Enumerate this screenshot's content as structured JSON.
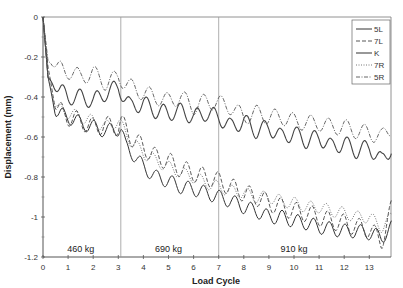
{
  "chart_data": {
    "type": "line",
    "title": "",
    "xlabel": "Load Cycle",
    "ylabel": "Displacement (mm)",
    "xlim": [
      0,
      14
    ],
    "ylim": [
      -1.2,
      0
    ],
    "x_ticks": [
      "0",
      "1",
      "2",
      "3",
      "4",
      "5",
      "6",
      "7",
      "8",
      "9",
      "10",
      "11",
      "12",
      "13"
    ],
    "y_ticks": [
      "0",
      "-0.2",
      "-0.4",
      "-0.6",
      "-0.8",
      "-1",
      "-1.2"
    ],
    "grid": false,
    "vertical_lines_at": [
      3.1,
      7.0
    ],
    "legend_position": "upper right",
    "annotations": [
      {
        "text": "460 kg",
        "x": 1.5,
        "y": -1.17
      },
      {
        "text": "690 kg",
        "x": 5.0,
        "y": -1.17
      },
      {
        "text": "910 kg",
        "x": 10.0,
        "y": -1.17
      }
    ],
    "series": [
      {
        "name": "5L",
        "style": "solid",
        "x": [
          0,
          0.2,
          0.5,
          1,
          1.5,
          2,
          2.5,
          3,
          3.1,
          3.3,
          3.7,
          4,
          4.5,
          5,
          5.5,
          6,
          6.5,
          7,
          7.5,
          8,
          8.5,
          9,
          9.5,
          10,
          10.5,
          11,
          11.5,
          12,
          12.5,
          13,
          13.5,
          13.9
        ],
        "y": [
          0,
          -0.3,
          -0.48,
          -0.5,
          -0.53,
          -0.55,
          -0.57,
          -0.56,
          -0.55,
          -0.65,
          -0.7,
          -0.75,
          -0.8,
          -0.82,
          -0.85,
          -0.86,
          -0.88,
          -0.9,
          -0.92,
          -0.95,
          -0.97,
          -1.0,
          -1.0,
          -1.02,
          -1.03,
          -1.05,
          -1.06,
          -1.07,
          -1.07,
          -1.08,
          -1.1,
          -1.05
        ]
      },
      {
        "name": "7L",
        "style": "dashed",
        "x": [
          0,
          0.2,
          0.5,
          1,
          1.5,
          2,
          2.5,
          3,
          3.1,
          3.5,
          4,
          4.5,
          5,
          5.5,
          6,
          6.5,
          7,
          7.5,
          8,
          8.5,
          9,
          9.5,
          10,
          10.5,
          11,
          11.5,
          12,
          12.5,
          13,
          13.5,
          13.9
        ],
        "y": [
          0,
          -0.25,
          -0.45,
          -0.5,
          -0.52,
          -0.55,
          -0.54,
          -0.55,
          -0.52,
          -0.6,
          -0.65,
          -0.7,
          -0.72,
          -0.76,
          -0.78,
          -0.8,
          -0.82,
          -0.85,
          -0.88,
          -0.9,
          -0.93,
          -0.95,
          -0.97,
          -0.98,
          -1.0,
          -1.02,
          -1.03,
          -1.05,
          -1.06,
          -1.12,
          -0.95
        ]
      },
      {
        "name": "K",
        "style": "solid-thin",
        "x": [
          0,
          0.2,
          0.5,
          1,
          1.5,
          2,
          2.5,
          3,
          3.5,
          4,
          4.5,
          5,
          5.5,
          6,
          6.5,
          7,
          7.5,
          8,
          8.5,
          9,
          9.5,
          10,
          10.5,
          11,
          11.5,
          12,
          12.5,
          13,
          13.5,
          13.9
        ],
        "y": [
          0,
          -0.3,
          -0.35,
          -0.4,
          -0.4,
          -0.42,
          -0.38,
          -0.35,
          -0.45,
          -0.43,
          -0.47,
          -0.48,
          -0.47,
          -0.5,
          -0.48,
          -0.5,
          -0.55,
          -0.52,
          -0.57,
          -0.55,
          -0.6,
          -0.58,
          -0.62,
          -0.6,
          -0.65,
          -0.63,
          -0.67,
          -0.65,
          -0.72,
          -0.65
        ]
      },
      {
        "name": "7R",
        "style": "dotted",
        "x": [
          0,
          0.2,
          0.5,
          1,
          1.5,
          2,
          2.5,
          3,
          3.5,
          4,
          4.5,
          5,
          5.5,
          6,
          6.5,
          7,
          7.5,
          8,
          8.5,
          9,
          9.5,
          10,
          10.5,
          11,
          11.5,
          12,
          12.5,
          13,
          13.5,
          13.9
        ],
        "y": [
          0,
          -0.3,
          -0.45,
          -0.48,
          -0.5,
          -0.52,
          -0.55,
          -0.52,
          -0.62,
          -0.68,
          -0.72,
          -0.75,
          -0.78,
          -0.8,
          -0.83,
          -0.85,
          -0.87,
          -0.88,
          -0.9,
          -0.9,
          -0.92,
          -0.93,
          -0.95,
          -0.95,
          -0.97,
          -0.98,
          -1.0,
          -1.0,
          -1.05,
          -1.0
        ]
      },
      {
        "name": "5R",
        "style": "dash-dot",
        "x": [
          0,
          0.2,
          0.5,
          1,
          1.5,
          2,
          2.5,
          3,
          3.5,
          4,
          4.5,
          5,
          5.5,
          6,
          6.5,
          7,
          7.5,
          8,
          8.5,
          9,
          9.5,
          10,
          10.5,
          11,
          11.5,
          12,
          12.5,
          13,
          13.5,
          13.9
        ],
        "y": [
          0,
          -0.22,
          -0.25,
          -0.27,
          -0.3,
          -0.28,
          -0.33,
          -0.3,
          -0.35,
          -0.38,
          -0.4,
          -0.42,
          -0.4,
          -0.45,
          -0.42,
          -0.43,
          -0.45,
          -0.5,
          -0.48,
          -0.5,
          -0.5,
          -0.52,
          -0.53,
          -0.53,
          -0.55,
          -0.55,
          -0.57,
          -0.58,
          -0.6,
          -0.55
        ]
      }
    ]
  }
}
